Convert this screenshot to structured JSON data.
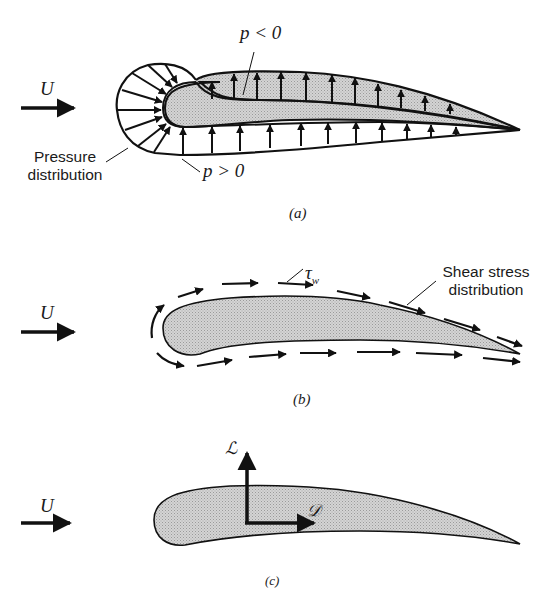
{
  "figure": {
    "panels": [
      {
        "id": "a",
        "caption": "(a)",
        "freestream_label": "U",
        "labels": {
          "suction": "p < 0",
          "pressure_side": "p > 0",
          "distribution_line1": "Pressure",
          "distribution_line2": "distribution"
        }
      },
      {
        "id": "b",
        "caption": "(b)",
        "freestream_label": "U",
        "labels": {
          "wall_shear": "τ",
          "wall_shear_sub": "w",
          "distribution_line1": "Shear stress",
          "distribution_line2": "distribution"
        }
      },
      {
        "id": "c",
        "caption": "(c)",
        "freestream_label": "U",
        "labels": {
          "lift": "ℒ",
          "drag": "𝒟"
        }
      }
    ],
    "colors": {
      "ink": "#111111",
      "airfoil_fill": "#c8c8c8",
      "background": "#ffffff"
    }
  }
}
